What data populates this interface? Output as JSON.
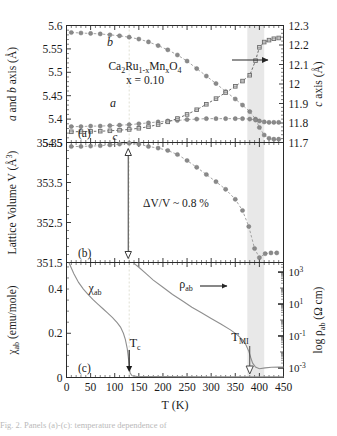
{
  "figure": {
    "xlabel": "T (K)",
    "sample_label_line1": "Ca2Ru1-xMnxO4",
    "sample_label_line2": "x = 0.10",
    "panel_a_tag": "(a)",
    "panel_b_tag": "(b)",
    "panel_c_tag": "(c)",
    "caption_fragment": "Fig. 2. Panels (a)-(c): temperature dependence of"
  },
  "axes": {
    "x": {
      "label": "T (K)",
      "min": 0,
      "max": 450,
      "ticks": [
        0,
        50,
        100,
        150,
        200,
        250,
        300,
        350,
        400,
        450
      ],
      "ticklabels": [
        "0",
        "50",
        "100",
        "150",
        "200",
        "250",
        "300",
        "350",
        "400",
        "450"
      ],
      "minor_step": 10
    },
    "a_left": {
      "label": "a and b axis (A)",
      "label_plain": "a and b axis (Å)",
      "min": 5.35,
      "max": 5.6,
      "ticks": [
        5.35,
        5.4,
        5.45,
        5.5,
        5.55,
        5.6
      ],
      "ticklabels": [
        "5.35",
        "5.4",
        "5.45",
        "5.5",
        "5.55",
        "5.6"
      ]
    },
    "a_right": {
      "label": "c axis (A)",
      "label_plain": "c axis (Å)",
      "min": 11.7,
      "max": 12.3,
      "ticks": [
        11.7,
        11.8,
        11.9,
        12.0,
        12.1,
        12.2,
        12.3
      ],
      "ticklabels": [
        "11.7",
        "11.8",
        "11.9",
        "12",
        "12.1",
        "12.2",
        "12.3"
      ]
    },
    "b_left": {
      "label": "Lattice Volume V (A3)",
      "label_plain": "Lattice Volume V (Å³)",
      "min": 351.5,
      "max": 354.5,
      "ticks": [
        351.5,
        352.5,
        353.5,
        354.5
      ],
      "ticklabels": [
        "351.5",
        "352.5",
        "353.5",
        "354.5"
      ]
    },
    "c_left": {
      "label": "Xab (emu/mole)",
      "label_plain": "χab (emu/mole)",
      "min": 0,
      "max": 0.52,
      "ticks": [
        0,
        0.2,
        0.4
      ],
      "ticklabels": [
        "0",
        "0.2",
        "0.4"
      ]
    },
    "c_right": {
      "label": "log pab (O cm)",
      "label_plain": "log ρab (Ω cm)",
      "min": -3.6,
      "max": 3.6,
      "ticks": [
        -3,
        -1,
        1,
        3
      ],
      "ticklabels": [
        "10-3",
        "10-1",
        "101",
        "103"
      ],
      "mantissa": [
        "10",
        "10",
        "10",
        "10"
      ],
      "exponents": [
        "-3",
        "-1",
        "1",
        "3"
      ]
    }
  },
  "annotations": {
    "curve_b": "b",
    "curve_a": "a",
    "curve_c": "c",
    "arrow_a_right": "arrow-to-right-axis",
    "delta_v": "ΔV/V ~ 0.8 %",
    "chi_label": "χab",
    "rho_label": "ρab",
    "rho_arrow": "arrow-to-right-axis",
    "tc_label": "Tc",
    "tmi_label": "TMI",
    "tc_value": 130,
    "tmi_value": 380,
    "shaded_band": {
      "from": 375,
      "to": 410,
      "color": "#e6e6e6"
    },
    "dashed_guide_k": 130
  },
  "colors": {
    "marker_gray": "#8a8a8a",
    "marker_open": "#6d6d6d",
    "line_gray": "#9a9a9a",
    "curve_c": "#8f8f8f",
    "axis": "#2a2a2a",
    "band": "#e8e8e8"
  },
  "chart_data": {
    "type": "line",
    "xlabel": "T (K)",
    "panels": [
      {
        "tag": "(a)",
        "ylabel": "a and b axis (Å)",
        "ylabel_right": "c axis (Å)",
        "ylim": [
          5.35,
          5.6
        ],
        "ylim_right": [
          11.7,
          12.3
        ],
        "series": [
          {
            "name": "b",
            "axis": "left",
            "marker": "filled-circle",
            "x": [
              10,
              30,
              50,
              70,
              90,
              110,
              130,
              150,
              170,
              190,
              210,
              230,
              250,
              270,
              290,
              310,
              330,
              350,
              365,
              380,
              392,
              400,
              410,
              420,
              430,
              440
            ],
            "y": [
              5.585,
              5.584,
              5.583,
              5.582,
              5.58,
              5.578,
              5.575,
              5.571,
              5.565,
              5.557,
              5.548,
              5.537,
              5.524,
              5.508,
              5.492,
              5.476,
              5.459,
              5.443,
              5.43,
              5.416,
              5.4,
              5.382,
              5.366,
              5.359,
              5.357,
              5.357
            ]
          },
          {
            "name": "a",
            "axis": "left",
            "marker": "filled-circle",
            "x": [
              10,
              30,
              50,
              70,
              90,
              110,
              130,
              150,
              170,
              190,
              210,
              230,
              250,
              270,
              290,
              310,
              330,
              350,
              365,
              380,
              392,
              400,
              410,
              420,
              430,
              440
            ],
            "y": [
              5.384,
              5.384,
              5.385,
              5.385,
              5.386,
              5.387,
              5.388,
              5.39,
              5.392,
              5.394,
              5.396,
              5.397,
              5.399,
              5.4,
              5.401,
              5.401,
              5.401,
              5.401,
              5.401,
              5.4,
              5.398,
              5.396,
              5.394,
              5.393,
              5.393,
              5.393
            ]
          },
          {
            "name": "c",
            "axis": "right",
            "marker": "open-square",
            "x": [
              10,
              30,
              50,
              70,
              90,
              110,
              130,
              150,
              170,
              190,
              210,
              230,
              250,
              270,
              290,
              310,
              330,
              350,
              365,
              380,
              392,
              400,
              410,
              420,
              430,
              440
            ],
            "y": [
              11.755,
              11.756,
              11.757,
              11.758,
              11.76,
              11.763,
              11.767,
              11.773,
              11.781,
              11.792,
              11.806,
              11.823,
              11.844,
              11.868,
              11.896,
              11.925,
              11.956,
              11.988,
              12.015,
              12.045,
              12.12,
              12.188,
              12.215,
              12.225,
              12.232,
              12.236
            ]
          }
        ]
      },
      {
        "tag": "(b)",
        "ylabel": "Lattice Volume V (Å³)",
        "ylim": [
          351.5,
          354.5
        ],
        "annotation": "ΔV/V ~ 0.8 %",
        "series": [
          {
            "name": "V",
            "axis": "left",
            "marker": "filled-circle",
            "x": [
              10,
              30,
              50,
              70,
              90,
              110,
              130,
              150,
              170,
              190,
              210,
              230,
              250,
              270,
              290,
              310,
              330,
              350,
              365,
              378,
              390,
              400,
              412,
              424,
              436
            ],
            "y": [
              354.4,
              354.4,
              354.41,
              354.42,
              354.44,
              354.46,
              354.48,
              354.46,
              354.4,
              354.36,
              354.3,
              354.2,
              354.05,
              353.88,
              353.7,
              353.52,
              353.33,
              353.08,
              352.8,
              352.4,
              351.85,
              351.62,
              351.72,
              351.74,
              351.74
            ]
          }
        ]
      },
      {
        "tag": "(c)",
        "ylabel": "χab (emu/mole)",
        "ylabel_right": "log ρab (Ω cm)",
        "ylim": [
          0,
          0.52
        ],
        "ylim_right_decades": [
          -3,
          3
        ],
        "series": [
          {
            "name": "chi_ab",
            "axis": "left",
            "marker": "line",
            "x": [
              5,
              15,
              25,
              35,
              45,
              55,
              65,
              75,
              85,
              95,
              105,
              112,
              118,
              122,
              126,
              128,
              130,
              132,
              136,
              145,
              200,
              300,
              400,
              450
            ],
            "y": [
              0.52,
              0.47,
              0.43,
              0.4,
              0.375,
              0.352,
              0.332,
              0.312,
              0.292,
              0.272,
              0.248,
              0.228,
              0.2,
              0.172,
              0.13,
              0.095,
              0.055,
              0.02,
              0.008,
              0.005,
              0.004,
              0.003,
              0.003,
              0.003
            ]
          },
          {
            "name": "rho_ab",
            "axis": "right",
            "marker": "line",
            "x": [
              140,
              150,
              165,
              180,
              200,
              220,
              240,
              260,
              280,
              300,
              320,
              340,
              355,
              365,
              372,
              378,
              382,
              386,
              392,
              400,
              412,
              425,
              440,
              450
            ],
            "y": [
              3.55,
              3.3,
              2.9,
              2.5,
              2.05,
              1.6,
              1.2,
              0.8,
              0.45,
              0.1,
              -0.25,
              -0.62,
              -0.95,
              -1.25,
              -1.55,
              -1.95,
              -2.35,
              -2.7,
              -2.95,
              -3.05,
              -3.0,
              -2.96,
              -2.95,
              -2.95
            ]
          }
        ],
        "markers": [
          {
            "label": "Tc",
            "x": 130,
            "style": "filled-down-arrow"
          },
          {
            "label": "TMI",
            "x": 380,
            "style": "open-down-arrow"
          }
        ]
      }
    ],
    "shaded_region": {
      "from": 375,
      "to": 410
    },
    "grid": false,
    "legend": "inline-curve-labels"
  }
}
